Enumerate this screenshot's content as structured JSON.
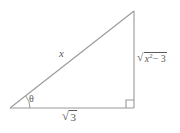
{
  "figure": {
    "type": "right-triangle-diagram",
    "stroke_color": "#999999",
    "label_color": "#5a5a5a",
    "background_color": "#ffffff",
    "vertices": {
      "left": [
        10,
        108
      ],
      "bottom_right": [
        134,
        108
      ],
      "apex": [
        134,
        11
      ]
    },
    "right_angle_marker": {
      "at_vertex": "bottom_right",
      "size": 8
    },
    "angle_arc": {
      "at_vertex": "left",
      "label": "θ"
    },
    "labels": {
      "hypotenuse": "x",
      "angle": "θ",
      "base_radical_sign": "√",
      "base_radicand": "3",
      "vertical_radical_sign": "√",
      "vertical_radicand_base": "x",
      "vertical_radicand_exponent": "2",
      "vertical_radicand_rest": "− 3"
    }
  }
}
